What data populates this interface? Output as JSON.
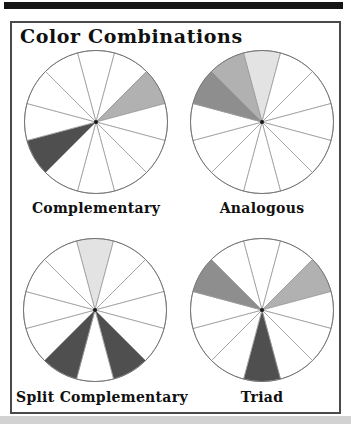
{
  "title": "Color Combinations",
  "wheels": [
    {
      "id": "complementary",
      "label": "Complementary",
      "segment_count": 12,
      "shaded": [
        {
          "segment_center_deg": 60,
          "color": "#b1b1b1"
        },
        {
          "segment_center_deg": 240,
          "color": "#4f4f4f"
        }
      ]
    },
    {
      "id": "analogous",
      "label": "Analogous",
      "segment_count": 12,
      "shaded": [
        {
          "segment_center_deg": 0,
          "color": "#e3e3e3"
        },
        {
          "segment_center_deg": 330,
          "color": "#b1b1b1"
        },
        {
          "segment_center_deg": 300,
          "color": "#8e8e8e"
        }
      ]
    },
    {
      "id": "split-complementary",
      "label": "Split Complementary",
      "segment_count": 12,
      "shaded": [
        {
          "segment_center_deg": 0,
          "color": "#e3e3e3"
        },
        {
          "segment_center_deg": 150,
          "color": "#4f4f4f"
        },
        {
          "segment_center_deg": 210,
          "color": "#4f4f4f"
        }
      ]
    },
    {
      "id": "triad",
      "label": "Triad",
      "segment_count": 12,
      "shaded": [
        {
          "segment_center_deg": 60,
          "color": "#b1b1b1"
        },
        {
          "segment_center_deg": 180,
          "color": "#4f4f4f"
        },
        {
          "segment_center_deg": 300,
          "color": "#8e8e8e"
        }
      ]
    }
  ],
  "colors": {
    "top_bar": "#141414",
    "frame_border": "#4a4a4a",
    "wheel_fill": "#ffffff",
    "wheel_outline": "#767676",
    "wheel_lines": "#9a9a9a",
    "center_dot": "#1a1a1a",
    "bottom_strip": "#d2d2d2",
    "text": "#101010"
  }
}
